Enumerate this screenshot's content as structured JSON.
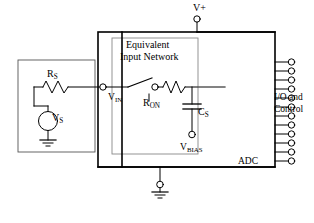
{
  "figure": {
    "type": "circuit-schematic"
  },
  "labels": {
    "v_plus": "V+",
    "equivalent_line1": "Equivalent",
    "equivalent_line2": "Input Network",
    "r_source": "R",
    "r_source_sub": "S",
    "v_in": "V",
    "v_in_sub": "IN",
    "r_on": "R",
    "r_on_sub": "ON",
    "c_s": "C",
    "c_s_sub": "S",
    "v_s": "V",
    "v_s_sub": "S",
    "v_bias": "V",
    "v_bias_sub": "BIAS",
    "io_line1": "I/O and",
    "io_line2": "Control",
    "adc": "ADC"
  },
  "components": {
    "source_block": {
      "name": "source-network-block"
    },
    "adc_block": {
      "name": "adc-block"
    },
    "inner_block": {
      "name": "equivalent-input-network-block"
    },
    "resistor_rs": {
      "name": "resistor-rs"
    },
    "resistor_ron": {
      "name": "resistor-ron"
    },
    "capacitor_cs": {
      "name": "capacitor-cs"
    },
    "voltage_source_vs": {
      "name": "voltage-source-vs"
    },
    "switch": {
      "name": "sampling-switch"
    },
    "pin_count": 12
  },
  "colors": {
    "line": "#000000",
    "background": "#ffffff",
    "thin_line": "#555555"
  }
}
